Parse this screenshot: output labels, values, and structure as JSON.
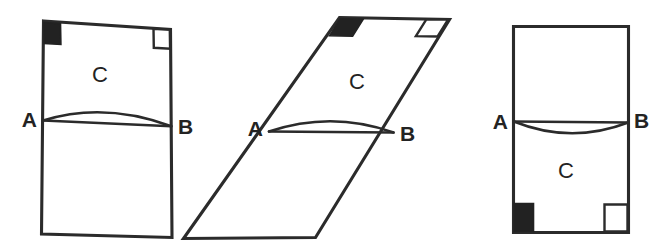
{
  "document": {
    "title": "Geometric Figures A B C",
    "background_color": "#ffffff",
    "ink_color": "#2b2b2b",
    "fill_color": "#222222",
    "width": 654,
    "height": 252
  },
  "figures": [
    {
      "id": "figure-left",
      "shape": "quadrilateral",
      "description": "Upright rectangle-like quadrilateral split by chord A-B with lens bulging upward",
      "region_label": "C",
      "region_position": "above chord",
      "arc_direction": "upward",
      "labels": {
        "left_vertex": "A",
        "right_vertex": "B",
        "region": "C"
      },
      "corner_markers": {
        "top_left": "filled-square",
        "top_right": "open-square"
      }
    },
    {
      "id": "figure-middle",
      "shape": "parallelogram",
      "description": "Slanted parallelogram split by chord A-B with lens bulging upward",
      "region_label": "C",
      "region_position": "above chord",
      "arc_direction": "upward",
      "labels": {
        "left_vertex": "A",
        "right_vertex": "B",
        "region": "C"
      },
      "corner_markers": {
        "top_left": "filled-parallelogram",
        "top_right": "open-parallelogram"
      }
    },
    {
      "id": "figure-right",
      "shape": "rectangle",
      "description": "Upright rectangle split by chord A-B with lens bulging downward",
      "region_label": "C",
      "region_position": "below chord",
      "arc_direction": "downward",
      "labels": {
        "left_vertex": "A",
        "right_vertex": "B",
        "region": "C"
      },
      "corner_markers": {
        "bottom_left": "filled-square",
        "bottom_right": "open-square"
      }
    }
  ]
}
